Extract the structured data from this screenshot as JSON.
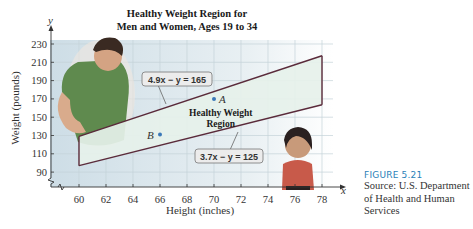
{
  "chart_data": {
    "type": "area",
    "title": [
      "Healthy Weight Region for",
      "Men and Women, Ages 19 to 34"
    ],
    "xlabel": "Height (inches)",
    "ylabel": "Weight (pounds)",
    "x_axis_var": "x",
    "y_axis_var": "y",
    "xlim": [
      58,
      79
    ],
    "ylim": [
      75,
      240
    ],
    "x_ticks": [
      60,
      62,
      64,
      66,
      68,
      70,
      72,
      74,
      76,
      78
    ],
    "y_ticks": [
      90,
      110,
      130,
      150,
      170,
      190,
      210,
      230
    ],
    "grid": true,
    "axis_break": "y",
    "region": {
      "label": [
        "Healthy Weight",
        "Region"
      ],
      "x_range": [
        60,
        78
      ],
      "upper_boundary": {
        "equation": "4.9x − y = 165",
        "slope": 4.9,
        "intercept": -165
      },
      "lower_boundary": {
        "equation": "3.7x − y = 125",
        "slope": 3.7,
        "intercept": -125
      },
      "fill": "#e6f1ea",
      "stroke": "#5a2a3a"
    },
    "points": [
      {
        "name": "A",
        "x": 70,
        "y": 170
      },
      {
        "name": "B",
        "x": 66,
        "y": 131
      }
    ],
    "plot_bg": "#d6e3ea",
    "point_color": "#3b78b8"
  },
  "caption": {
    "figure": "FIGURE 5.21",
    "source_lines": [
      "Source: U.S. Department",
      "of Health and Human",
      "Services"
    ]
  }
}
